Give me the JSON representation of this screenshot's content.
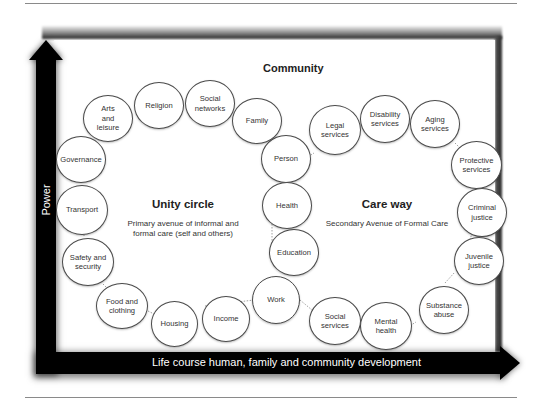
{
  "diagram": {
    "title": "Community",
    "axes": {
      "y_label": "Power",
      "x_label": "Life course human, family and community development"
    },
    "sections": {
      "unity": {
        "title": "Unity circle",
        "subtitle_line1": "Primary avenue of informal and",
        "subtitle_line2": "formal care (self and others)"
      },
      "care": {
        "title": "Care way",
        "subtitle": "Secondary Avenue of Formal Care"
      }
    },
    "unity_circle_nodes": [
      {
        "label": "Person"
      },
      {
        "label": "Family"
      },
      {
        "label": "Social\nnetworks"
      },
      {
        "label": "Religion"
      },
      {
        "label": "Arts\nand\nleisure"
      },
      {
        "label": "Governance"
      },
      {
        "label": "Transport"
      },
      {
        "label": "Safety and\nsecurity"
      },
      {
        "label": "Food and\nclothing"
      },
      {
        "label": "Housing"
      },
      {
        "label": "Income"
      },
      {
        "label": "Work"
      },
      {
        "label": "Education"
      },
      {
        "label": "Health"
      }
    ],
    "care_way_nodes": [
      {
        "label": "Legal\nservices"
      },
      {
        "label": "Disability\nservices"
      },
      {
        "label": "Aging\nservices"
      },
      {
        "label": "Protective\nservices"
      },
      {
        "label": "Criminal\njustice"
      },
      {
        "label": "Juvenile\njustice"
      },
      {
        "label": "Substance\nabuse"
      },
      {
        "label": "Mental\nhealth"
      },
      {
        "label": "Social\nservices"
      }
    ]
  }
}
